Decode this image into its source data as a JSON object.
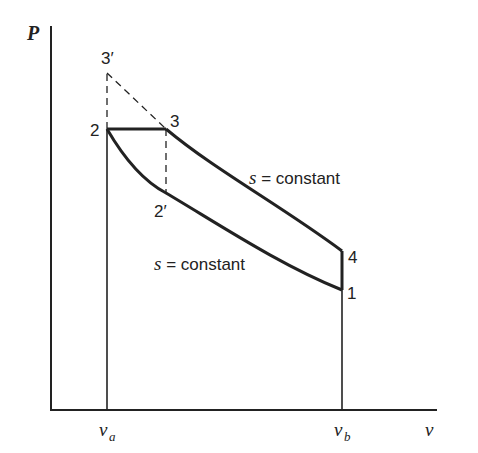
{
  "diagram": {
    "type": "P-v diagram",
    "axes": {
      "y_label": "P",
      "x_label": "v",
      "x_ticks": [
        {
          "base": "v",
          "sub": "a"
        },
        {
          "base": "v",
          "sub": "b"
        }
      ]
    },
    "points": [
      {
        "id": "1",
        "label": "1"
      },
      {
        "id": "2",
        "label": "2"
      },
      {
        "id": "2p",
        "label": "2′"
      },
      {
        "id": "3",
        "label": "3"
      },
      {
        "id": "3p",
        "label": "3′"
      },
      {
        "id": "4",
        "label": "4"
      }
    ],
    "curve_labels": {
      "upper": {
        "var": "s",
        "rest": " = constant"
      },
      "lower": {
        "var": "s",
        "rest": " = constant"
      }
    },
    "colors": {
      "line": "#222222",
      "background": "#ffffff"
    }
  }
}
